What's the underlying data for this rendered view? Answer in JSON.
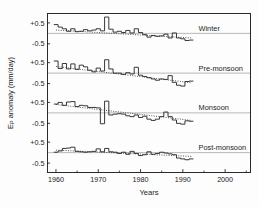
{
  "chart_data": {
    "type": "line",
    "title": "",
    "xlabel": "Years",
    "ylabel": "E_P anomaly (mm/day)",
    "ylabel_main": "E",
    "ylabel_sub": "P",
    "ylabel_rest": " anomaly (mm/day)",
    "xlim": [
      1958,
      2006
    ],
    "xticks": [
      1960,
      1970,
      1980,
      1990,
      2000
    ],
    "xtick_labels": [
      "1960",
      "1970",
      "1980",
      "1990",
      "2000"
    ],
    "xminor_ticks": [
      1965,
      1975,
      1985,
      1995,
      2005
    ],
    "yticks_per_panel": [
      0.5,
      -0.5
    ],
    "ytick_labels": [
      "+0.5",
      "-0.5"
    ],
    "panel_ylim": [
      -0.95,
      0.95
    ],
    "grid": false,
    "legend_position": "right-inline",
    "zero_reference_line": true,
    "trend_line_style": "dotted",
    "series_style": "step",
    "series": [
      {
        "name": "Winter",
        "label": "Winter",
        "x": [
          1960,
          1961,
          1962,
          1963,
          1964,
          1965,
          1966,
          1967,
          1968,
          1969,
          1970,
          1971,
          1972,
          1973,
          1974,
          1975,
          1976,
          1977,
          1978,
          1979,
          1980,
          1981,
          1982,
          1983,
          1984,
          1985,
          1986,
          1987,
          1988,
          1989,
          1990,
          1991,
          1992
        ],
        "values": [
          0.42,
          0.3,
          0.22,
          0.1,
          0.22,
          0.08,
          0.1,
          0.18,
          0.12,
          0.16,
          0.22,
          0.12,
          0.78,
          0.2,
          0.06,
          0.1,
          0.04,
          0.14,
          0.02,
          0.22,
          0.04,
          -0.06,
          -0.18,
          -0.1,
          -0.14,
          -0.12,
          -0.04,
          -0.22,
          0.02,
          -0.22,
          -0.26,
          -0.34,
          -0.32
        ],
        "trend": {
          "x": [
            1960,
            1992
          ],
          "y": [
            0.16,
            -0.22
          ]
        }
      },
      {
        "name": "Pre-monsoon",
        "label": "Pre-monsoon",
        "x": [
          1960,
          1961,
          1962,
          1963,
          1964,
          1965,
          1966,
          1967,
          1968,
          1969,
          1970,
          1971,
          1972,
          1973,
          1974,
          1975,
          1976,
          1977,
          1978,
          1979,
          1980,
          1981,
          1982,
          1983,
          1984,
          1985,
          1986,
          1987,
          1988,
          1989,
          1990,
          1991,
          1992
        ],
        "values": [
          0.58,
          0.22,
          0.46,
          0.2,
          0.44,
          0.18,
          0.38,
          0.3,
          0.14,
          0.06,
          0.24,
          0.1,
          0.64,
          0.2,
          0.0,
          0.0,
          -0.06,
          0.02,
          -0.04,
          0.28,
          -0.1,
          -0.16,
          -0.22,
          -0.28,
          -0.34,
          -0.28,
          -0.3,
          -0.12,
          -0.44,
          -0.58,
          -0.62,
          -0.4,
          -0.38
        ],
        "trend": {
          "x": [
            1960,
            1992
          ],
          "y": [
            0.32,
            -0.46
          ]
        }
      },
      {
        "name": "Monsoon",
        "label": "Monsoon",
        "x": [
          1960,
          1961,
          1962,
          1963,
          1964,
          1965,
          1966,
          1967,
          1968,
          1969,
          1970,
          1971,
          1972,
          1973,
          1974,
          1975,
          1976,
          1977,
          1978,
          1979,
          1980,
          1981,
          1982,
          1983,
          1984,
          1985,
          1986,
          1987,
          1988,
          1989,
          1990,
          1991,
          1992
        ],
        "values": [
          0.42,
          0.5,
          0.36,
          0.52,
          0.54,
          0.3,
          0.36,
          0.34,
          0.26,
          0.26,
          0.24,
          -0.52,
          0.56,
          -0.1,
          -0.06,
          -0.04,
          -0.06,
          -0.14,
          -0.18,
          -0.1,
          -0.22,
          -0.16,
          -0.3,
          -0.36,
          -0.3,
          -0.18,
          0.04,
          -0.18,
          -0.34,
          -0.5,
          -0.54,
          -0.38,
          -0.4
        ],
        "trend": {
          "x": [
            1960,
            1992
          ],
          "y": [
            0.4,
            -0.36
          ]
        }
      },
      {
        "name": "Post-monsoon",
        "label": "Post-monsoon",
        "x": [
          1960,
          1961,
          1962,
          1963,
          1964,
          1965,
          1966,
          1967,
          1968,
          1969,
          1970,
          1971,
          1972,
          1973,
          1974,
          1975,
          1976,
          1977,
          1978,
          1979,
          1980,
          1981,
          1982,
          1983,
          1984,
          1985,
          1986,
          1987,
          1988,
          1989,
          1990,
          1991,
          1992
        ],
        "values": [
          0.02,
          0.08,
          0.2,
          0.22,
          0.26,
          0.06,
          0.04,
          0.02,
          0.04,
          0.06,
          0.18,
          0.04,
          0.2,
          0.04,
          0.02,
          -0.04,
          0.02,
          -0.08,
          0.06,
          -0.04,
          -0.14,
          -0.1,
          0.04,
          -0.08,
          -0.04,
          0.02,
          -0.02,
          -0.06,
          -0.1,
          -0.26,
          -0.3,
          -0.34,
          -0.3
        ],
        "trend": {
          "x": [
            1960,
            1992
          ],
          "y": [
            0.12,
            -0.18
          ]
        }
      }
    ]
  },
  "figure": {
    "xaxis_title": "Years",
    "panel_labels": [
      "Winter",
      "Pre-monsoon",
      "Monsoon",
      "Post-monsoon"
    ],
    "xtick_labels": [
      "1960",
      "1970",
      "1980",
      "1990",
      "2000"
    ],
    "ytick_labels": [
      "+0.5",
      "-0.5"
    ]
  },
  "colors": {
    "axis": "#2a2a2a",
    "data_line": "#2e2e2e",
    "trend_line": "#3a3a3a",
    "zero_line": "#b0b0b0",
    "background": "#fdfdfd",
    "text": "#1c1c1c"
  }
}
